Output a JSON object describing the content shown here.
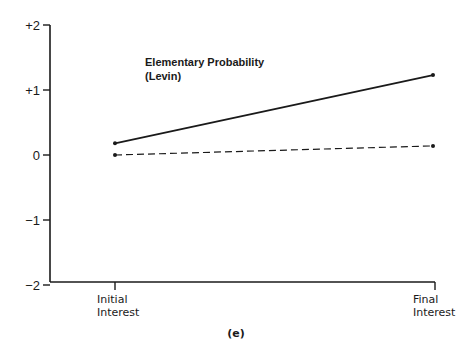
{
  "chart_data": {
    "type": "line",
    "title": "Elementary Probability (Levin)",
    "title_lines": [
      "Elementary Probability",
      "(Levin)"
    ],
    "caption": "(e)",
    "xlabel": "",
    "ylabel": "",
    "categories": [
      "Initial Interest",
      "Final Interest"
    ],
    "category_lines": [
      [
        "Initial",
        "Interest"
      ],
      [
        "Final",
        "Interest"
      ]
    ],
    "ylim": [
      -2,
      2
    ],
    "yticks": [
      2,
      1,
      0,
      -1,
      -2
    ],
    "ytick_labels": [
      "+2",
      "+1",
      "0",
      "−1",
      "−2"
    ],
    "grid": false,
    "legend": null,
    "series": [
      {
        "name": "solid",
        "style": "solid",
        "values": [
          0.18,
          1.23
        ]
      },
      {
        "name": "dashed",
        "style": "dashed",
        "values": [
          0.0,
          0.14
        ]
      }
    ]
  },
  "colors": {
    "ink": "#1a1a1a",
    "background": "#ffffff"
  }
}
